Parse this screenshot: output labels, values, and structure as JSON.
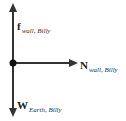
{
  "diagram": {
    "type": "free-body-diagram",
    "colors": {
      "arrow": "#333333",
      "point": "#111111",
      "text": "#222222"
    },
    "forces": [
      {
        "symbol": "f",
        "subscript": "wall, Billy",
        "direction": "up"
      },
      {
        "symbol": "N",
        "subscript": "wall, Billy",
        "direction": "right"
      },
      {
        "symbol": "W",
        "subscript": "Earth, Billy",
        "direction": "down"
      }
    ]
  }
}
